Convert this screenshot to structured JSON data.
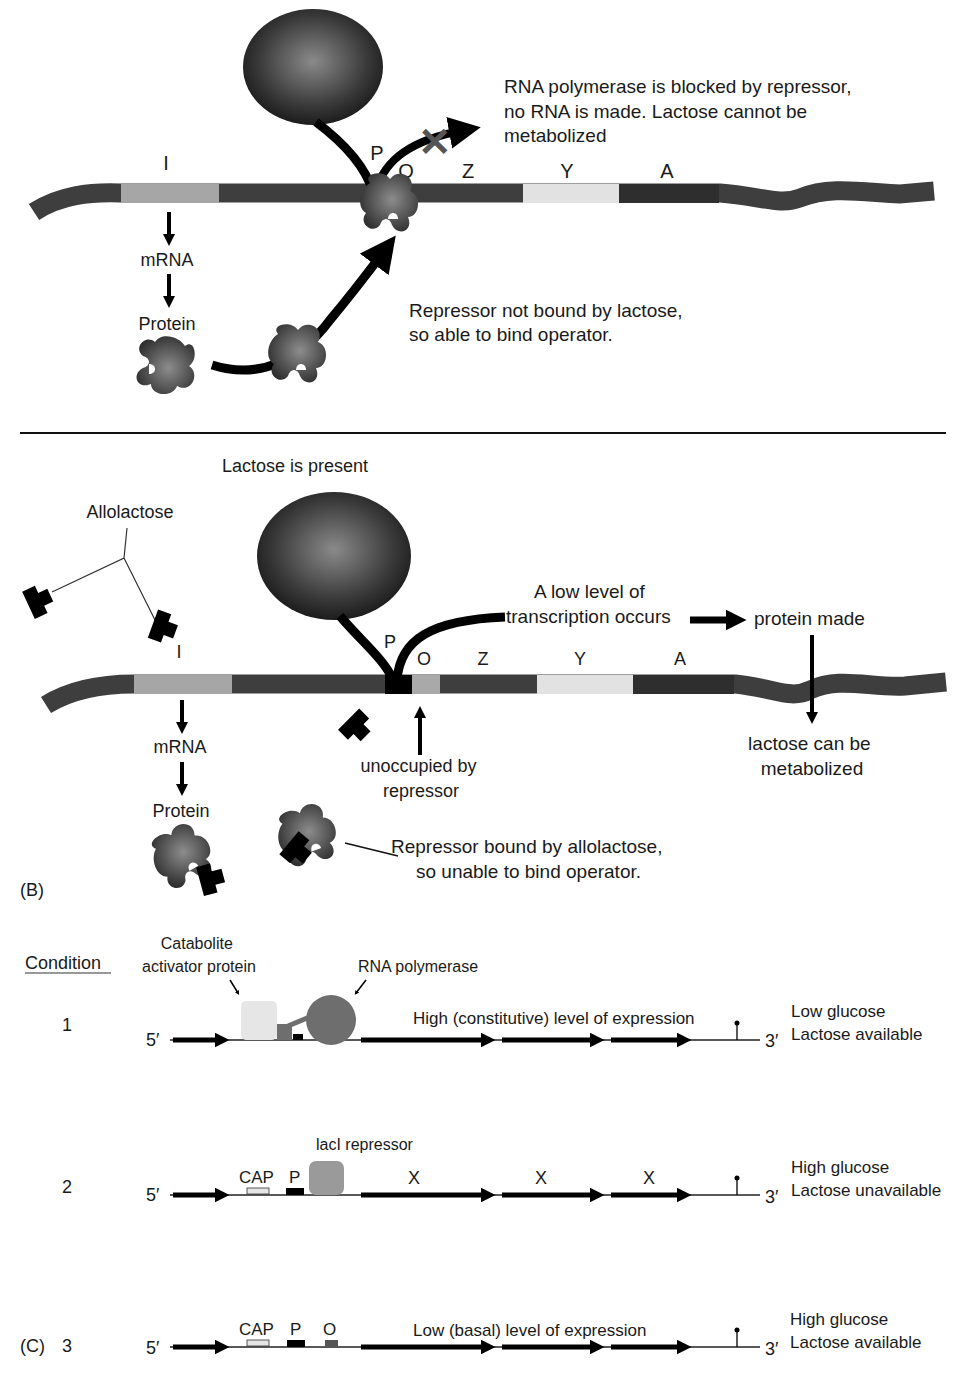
{
  "panel_a": {
    "gene_labels": {
      "I": "I",
      "P": "P",
      "O": "O",
      "Z": "Z",
      "Y": "Y",
      "A": "A"
    },
    "flow": {
      "mrna": "mRNA",
      "protein": "Protein"
    },
    "blocked_note": [
      "RNA polymerase is blocked by repressor,",
      "no RNA is made. Lactose cannot be",
      "metabolized"
    ],
    "repressor_note": [
      "Repressor not bound by lactose,",
      "so able to bind operator."
    ]
  },
  "panel_b": {
    "panel_label": "(B)",
    "title": "Lactose is present",
    "allolactose_label": "Allolactose",
    "gene_labels": {
      "I": "I",
      "P": "P",
      "O": "O",
      "Z": "Z",
      "Y": "Y",
      "A": "A"
    },
    "flow": {
      "mrna": "mRNA",
      "protein": "Protein"
    },
    "transcription_note": [
      "A  low level of",
      "transcription occurs"
    ],
    "protein_made": "protein made",
    "metabolized_note": [
      "lactose can be",
      "metabolized"
    ],
    "operator_note": [
      "unoccupied by",
      "repressor"
    ],
    "repressor_note": [
      "Repressor bound by allolactose,",
      "so unable to bind operator."
    ]
  },
  "panel_c": {
    "panel_label": "(C)",
    "condition_header": "Condition",
    "cap_callout": [
      "Catabolite",
      "activator protein"
    ],
    "rnap_callout": "RNA polymerase",
    "repressor_callout": "lacI repressor",
    "five_prime": "5′",
    "three_prime": "3′",
    "rows": [
      {
        "number": "1",
        "expression": "High (constitutive) level of expression",
        "conditions": [
          "Low glucose",
          "Lactose available"
        ]
      },
      {
        "number": "2",
        "site_labels": [
          "CAP",
          "P"
        ],
        "gene_marks": [
          "X",
          "X",
          "X"
        ],
        "conditions": [
          "High glucose",
          "Lactose unavailable"
        ]
      },
      {
        "number": "3",
        "site_labels": [
          "CAP",
          "P",
          "O"
        ],
        "expression": "Low (basal) level of expression",
        "conditions": [
          "High glucose",
          "Lactose available"
        ]
      }
    ]
  },
  "colors": {
    "dna_dark": "#3e3e3e",
    "gene_i": "#a6a6a6",
    "gene_y": "#e2e2e2",
    "gene_a": "#2e2e2e",
    "operator": "#a9a9a9",
    "cap_protein": "#e6e6e6",
    "rnap_small": "#6e6e6e",
    "laci": "#9a9a9a",
    "x_mark": "#555555"
  }
}
